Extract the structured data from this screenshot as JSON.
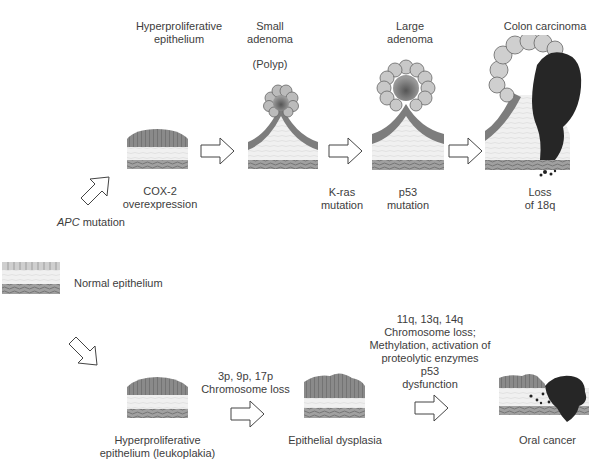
{
  "colon_pathway": {
    "initiation": {
      "gene": "APC",
      "suffix": " mutation"
    },
    "stages": [
      {
        "id": "hyperproliferative",
        "title_lines": [
          "Hyperproliferative",
          "epithelium"
        ],
        "event_lines": [
          "COX-2",
          "overexpression"
        ]
      },
      {
        "id": "small-adenoma",
        "title_lines": [
          "Small",
          "adenoma"
        ],
        "subtitle": "(Polyp)",
        "event_lines": [
          "K-ras",
          "mutation"
        ]
      },
      {
        "id": "large-adenoma",
        "title_lines": [
          "Large",
          "adenoma"
        ],
        "event_lines": [
          "p53",
          "mutation"
        ]
      },
      {
        "id": "colon-carcinoma",
        "title_lines": [
          "Colon carcinoma"
        ],
        "event_lines": [
          "Loss",
          "of 18q"
        ]
      }
    ]
  },
  "start": {
    "label": "Normal epithelium"
  },
  "oral_pathway": {
    "stages": [
      {
        "id": "leukoplakia",
        "label_lines": [
          "Hyperproliferative",
          "epithelium (leukoplakia)"
        ]
      },
      {
        "id": "dysplasia",
        "label_lines": [
          "Epithelial dysplasia"
        ]
      },
      {
        "id": "oral-cancer",
        "label_lines": [
          "Oral cancer"
        ]
      }
    ],
    "transitions": [
      {
        "lines": [
          "3p, 9p, 17p",
          "Chromosome loss"
        ]
      },
      {
        "lines": [
          "11q, 13q, 14q",
          "Chromosome loss;",
          "Methylation, activation of",
          "proteolytic enzymes",
          "p53",
          "dysfunction"
        ]
      }
    ]
  },
  "colors": {
    "background": "#ffffff",
    "text": "#3d3d3d",
    "epithelium": "#7a7a7a",
    "tumor": "#262626",
    "stroma": "#e6e6e6"
  }
}
